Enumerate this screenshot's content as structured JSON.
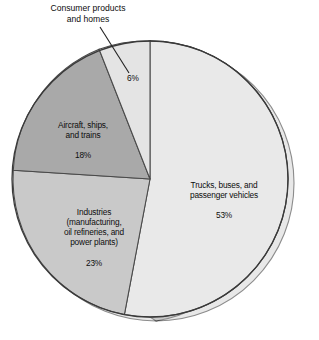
{
  "chart_data": {
    "type": "pie",
    "title": "",
    "subtitle": "",
    "xlabel": "",
    "ylabel": "",
    "legend_position": "none",
    "grid": false,
    "units": "percent",
    "total": 100,
    "start_angle_deg": 0,
    "direction": "clockwise",
    "categories": [
      "Trucks, buses, and passenger vehicles",
      "Industries (manufacturing, oil refineries, and power plants)",
      "Aircraft, ships, and trains",
      "Consumer products and homes"
    ],
    "values": [
      53,
      23,
      18,
      6
    ],
    "slices": [
      {
        "key": "trucks",
        "label_lines": "Trucks, buses, and\npassenger vehicles",
        "value": 53,
        "value_label": "53%",
        "color": "#e9e9e9",
        "label_placement": "inside"
      },
      {
        "key": "industries",
        "label_lines": "Industries\n(manufacturing,\noil refineries, and\npower plants)",
        "value": 23,
        "value_label": "23%",
        "color": "#c9c9c9",
        "label_placement": "inside"
      },
      {
        "key": "aircraft",
        "label_lines": "Aircraft, ships,\nand trains",
        "value": 18,
        "value_label": "18%",
        "color": "#a9a9a9",
        "label_placement": "inside"
      },
      {
        "key": "consumer",
        "label_lines": "Consumer products\nand homes",
        "value": 6,
        "value_label": "6%",
        "color": "#e4e4e4",
        "label_placement": "callout"
      }
    ]
  },
  "figure": {
    "trucks_label": "Trucks, buses, and\npassenger vehicles",
    "trucks_pct": "53%",
    "industries_label": "Industries\n(manufacturing,\noil refineries, and\npower plants)",
    "industries_pct": "23%",
    "aircraft_label": "Aircraft, ships,\nand trains",
    "aircraft_pct": "18%",
    "consumer_label": "Consumer products\nand homes",
    "consumer_pct": "6%"
  },
  "colors": {
    "background": "#ffffff",
    "outline": "#3a3a3a",
    "depth_shadow": "#b4b4b4",
    "depth_edge": "#2e2e2e",
    "text": "#0d0d0d"
  }
}
